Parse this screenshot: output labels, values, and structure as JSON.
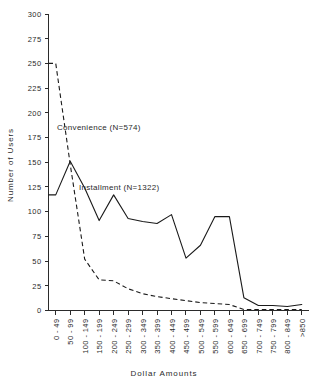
{
  "chart_data": {
    "type": "line",
    "title": "",
    "xlabel": "Dollar Amounts",
    "ylabel": "Number of Users",
    "ylim": [
      0,
      300
    ],
    "ytick_step": 25,
    "yticks": [
      0,
      25,
      50,
      75,
      100,
      125,
      150,
      175,
      200,
      225,
      250,
      275,
      300
    ],
    "grid": false,
    "legend_position": "inline-annotation",
    "categories": [
      "0 - 49",
      "50 - 99",
      "100 - 149",
      "150 - 199",
      "200 - 249",
      "250 - 299",
      "300 - 349",
      "350 - 399",
      "400 - 449",
      "450 - 499",
      "500 - 549",
      "550 - 599",
      "600 - 649",
      "650 - 699",
      "700 - 749",
      "750 - 799",
      "800 - 849",
      ">850"
    ],
    "series": [
      {
        "name": "Convenience",
        "label": "Convenience  (N=574)",
        "n": 574,
        "style": "dashed",
        "values": [
          250,
          148,
          52,
          31,
          30,
          22,
          17,
          14,
          12,
          10,
          8,
          7,
          6,
          1,
          1,
          1,
          1,
          1
        ]
      },
      {
        "name": "Installment",
        "label": "Installment  (N=1322)",
        "n": 1322,
        "style": "solid",
        "values": [
          117,
          151,
          124,
          91,
          117,
          93,
          90,
          88,
          97,
          53,
          66,
          95,
          95,
          13,
          5,
          5,
          4,
          6
        ]
      }
    ],
    "annotations": [
      {
        "text": "Convenience  (N=574)",
        "series": "Convenience"
      },
      {
        "text": "Installment  (N=1322)",
        "series": "Installment"
      }
    ]
  },
  "colors": {
    "ink": "#1a1a1a",
    "axis": "#2b2b2b",
    "background": "#ffffff"
  }
}
